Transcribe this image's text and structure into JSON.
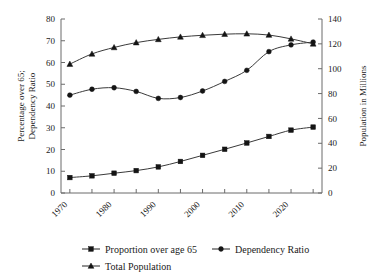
{
  "chart_data": {
    "type": "line",
    "title": "",
    "xlabel": "",
    "ylabel": "Percentage over 65;\nDependency Ratio",
    "ylabel_left": "Percentage over 65; Dependency Ratio",
    "ylabel_right": "Population in Millions",
    "grid": false,
    "legend_position": "bottom",
    "x": [
      1970,
      1975,
      1980,
      1985,
      1990,
      1995,
      2000,
      2005,
      2010,
      2015,
      2020,
      2025
    ],
    "xlim": [
      1968,
      2027
    ],
    "xticks_major": [
      1970,
      1980,
      1990,
      2000,
      2010,
      2020
    ],
    "xticks_all": [
      1970,
      1975,
      1980,
      1985,
      1990,
      1995,
      2000,
      2005,
      2010,
      2015,
      2020,
      2025
    ],
    "xticklabels": [
      "1970",
      "1980",
      "1990",
      "2000",
      "2010",
      "2020"
    ],
    "ylim_left": [
      0,
      80
    ],
    "yticks_left": [
      0,
      10,
      20,
      30,
      40,
      50,
      60,
      70,
      80
    ],
    "yticklabels_left": [
      "0",
      "10",
      "20",
      "30",
      "40",
      "50",
      "60",
      "70",
      "80"
    ],
    "ylim_right": [
      0,
      140
    ],
    "yticks_right": [
      0,
      20,
      40,
      60,
      80,
      100,
      120,
      140
    ],
    "yticklabels_right": [
      "0",
      "20",
      "40",
      "60",
      "80",
      "100",
      "120",
      "140"
    ],
    "series": [
      {
        "name": "Proportion over age 65",
        "marker": "square",
        "axis": "left",
        "values": [
          7.1,
          7.9,
          9.1,
          10.3,
          12.0,
          14.5,
          17.3,
          20.1,
          23.0,
          26.0,
          28.9,
          30.3
        ],
        "values_right_scale": [
          12.4,
          13.8,
          15.9,
          18.0,
          21.0,
          25.4,
          30.3,
          35.2,
          40.3,
          45.5,
          50.6,
          53.0
        ]
      },
      {
        "name": "Dependency Ratio",
        "marker": "diamond",
        "axis": "left",
        "values": [
          45.0,
          47.7,
          48.4,
          46.7,
          43.5,
          43.9,
          46.9,
          51.3,
          56.4,
          65.0,
          68.1,
          69.4
        ]
      },
      {
        "name": "Total Population",
        "marker": "triangle",
        "axis": "right",
        "values": [
          103.7,
          111.9,
          117.1,
          121.0,
          123.6,
          125.6,
          126.9,
          127.8,
          128.1,
          127.1,
          124.0,
          120.0
        ],
        "values_left_scale": [
          59.3,
          63.9,
          66.9,
          69.1,
          70.6,
          71.8,
          72.5,
          73.0,
          73.2,
          72.6,
          70.9,
          68.6
        ]
      }
    ]
  },
  "legend": {
    "items": [
      {
        "label": "Proportion over age 65",
        "marker": "square"
      },
      {
        "label": "Dependency Ratio",
        "marker": "diamond"
      },
      {
        "label": "Total Population",
        "marker": "triangle"
      }
    ]
  }
}
